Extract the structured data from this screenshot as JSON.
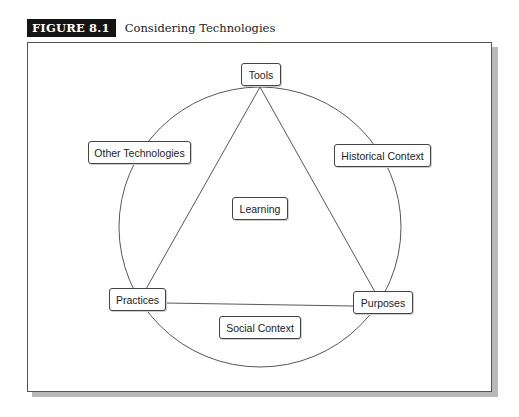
{
  "figure": {
    "label": "FIGURE 8.1",
    "title": "Considering Technologies"
  },
  "diagram": {
    "nodes": {
      "tools": "Tools",
      "other_technologies": "Other Technologies",
      "historical_context": "Historical Context",
      "learning": "Learning",
      "practices": "Practices",
      "purposes": "Purposes",
      "social_context": "Social Context"
    },
    "structure": {
      "circle": "outer circle through Tools, Other Technologies, Historical Context, Practices, Purposes",
      "triangle": [
        "Tools",
        "Practices",
        "Purposes"
      ],
      "center": "Learning",
      "below_base": "Social Context"
    },
    "colors": {
      "badge_bg": "#141414",
      "badge_text": "#ffffff",
      "line": "#444444",
      "shadow": "#b9b9b9"
    }
  }
}
